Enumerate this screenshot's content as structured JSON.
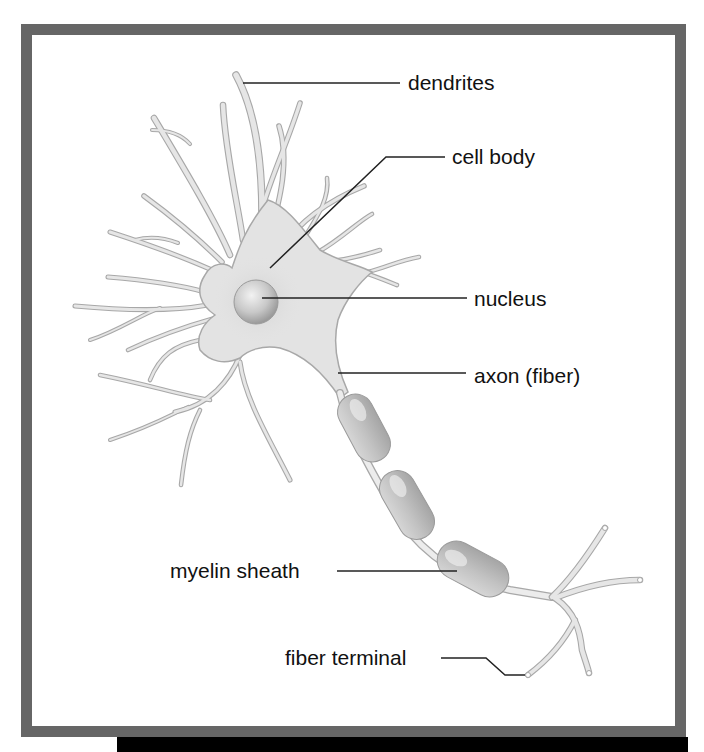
{
  "colors": {
    "frame": "#666666",
    "cytoplasm": "#e3e3e3",
    "outline": "#a8a8a8",
    "myelin": "#b9b9b9",
    "label_text": "#111111",
    "leader_line": "#222222"
  },
  "labels": {
    "dendrites": "dendrites",
    "cell_body": "cell body",
    "nucleus": "nucleus",
    "axon": "axon (fiber)",
    "myelin_sheath": "myelin sheath",
    "fiber_terminal": "fiber terminal"
  },
  "myelin_segment_count": 3
}
